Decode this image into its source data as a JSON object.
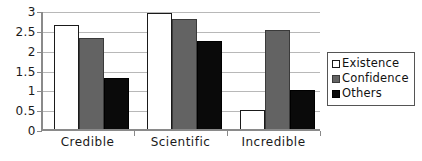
{
  "chart_data": {
    "type": "bar",
    "title": "",
    "subtitle": "",
    "xlabel": "",
    "ylabel": "",
    "categories": [
      "Credible",
      "Scientific",
      "Incredible"
    ],
    "series": [
      {
        "name": "Existence",
        "color": "#ffffff",
        "values": [
          2.67,
          2.97,
          0.53
        ]
      },
      {
        "name": "Confidence",
        "color": "#636363",
        "values": [
          2.34,
          2.82,
          2.54
        ]
      },
      {
        "name": "Others",
        "color": "#0a0a0a",
        "values": [
          1.33,
          2.27,
          1.03
        ]
      }
    ],
    "ylim": [
      0,
      3
    ],
    "yticks": [
      0,
      0.5,
      1,
      1.5,
      2,
      2.5,
      3
    ],
    "ytick_labels": [
      "0",
      "0.5",
      "1",
      "1.5",
      "2",
      "2.5",
      "3"
    ],
    "grid": true,
    "grid_axis": "y",
    "legend_position": "right",
    "annotations": []
  },
  "legend": {
    "entries": [
      {
        "label": "Existence",
        "swatch": "white-square-swatch"
      },
      {
        "label": "Confidence",
        "swatch": "gray-square-swatch"
      },
      {
        "label": "Others",
        "swatch": "black-square-swatch"
      }
    ]
  },
  "colors": {
    "existence": "#ffffff",
    "confidence": "#636363",
    "others": "#0a0a0a",
    "axis": "#8a8a8a",
    "gridline": "#b8b8b8",
    "text": "#1a1a1a",
    "background": "#ffffff"
  }
}
